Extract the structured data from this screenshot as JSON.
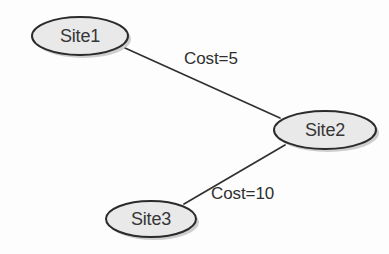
{
  "diagram": {
    "background_color": "#fdfdfd",
    "node_fill_color": "#e9e9e9",
    "node_stroke_color": "#2b2b2b",
    "edge_color": "#30302f",
    "text_color": "#363636",
    "nodes": [
      {
        "id": "site1",
        "label": "Site1",
        "shape": "ellipse",
        "cx": 80,
        "cy": 36,
        "rx": 48,
        "ry": 19
      },
      {
        "id": "site2",
        "label": "Site2",
        "shape": "ellipse",
        "cx": 325,
        "cy": 130,
        "rx": 51,
        "ry": 19
      },
      {
        "id": "site3",
        "label": "Site3",
        "shape": "ellipse",
        "cx": 151,
        "cy": 219,
        "rx": 45,
        "ry": 18
      }
    ],
    "edges": [
      {
        "id": "edge-site1-site2",
        "from": "site1",
        "to": "site2",
        "label": "Cost=5",
        "cost": 5,
        "x1": 125,
        "y1": 48,
        "x2": 280,
        "y2": 118,
        "label_x": 184,
        "label_y": 60
      },
      {
        "id": "edge-site2-site3",
        "from": "site2",
        "to": "site3",
        "label": "Cost=10",
        "cost": 10,
        "x1": 285,
        "y1": 145,
        "x2": 184,
        "y2": 204,
        "label_x": 211,
        "label_y": 195
      }
    ]
  }
}
